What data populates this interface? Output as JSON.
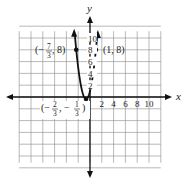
{
  "chart_data": {
    "type": "line",
    "title": "",
    "xlabel": "x",
    "ylabel": "y",
    "xlim": [
      -12,
      12
    ],
    "ylim": [
      -12,
      12
    ],
    "grid": true,
    "grid_step": 2,
    "x_tick_labels": [
      "2",
      "4",
      "6",
      "8",
      "10"
    ],
    "x_ticks": [
      2,
      4,
      6,
      8,
      10
    ],
    "y_tick_labels": [
      "2",
      "4",
      "6",
      "8",
      "10"
    ],
    "y_ticks": [
      2,
      4,
      6,
      8,
      10
    ],
    "series": [
      {
        "name": "parabola",
        "equation": "y = 3x^2 + 4x + 1",
        "vertex": [
          -0.6667,
          -0.3333
        ],
        "x": [
          -2.6,
          -2.3333,
          -2,
          -1.5,
          -1,
          -0.6667,
          -0.3333,
          0,
          0.5,
          1,
          1.25
        ],
        "y": [
          10.88,
          8,
          5,
          1.75,
          0,
          -0.3333,
          0,
          1,
          3.75,
          8,
          10.69
        ]
      }
    ],
    "annotations": [
      {
        "point": [
          -2.3333,
          8
        ],
        "label_text": "(−7/3, 8)",
        "num": "7",
        "den": "3",
        "prefix": "(−",
        "suffix": ", 8)"
      },
      {
        "point": [
          1,
          8
        ],
        "label_text": "(1, 8)"
      },
      {
        "point": [
          -0.6667,
          -0.3333
        ],
        "label_text": "(−2/3, −1/3)"
      }
    ]
  },
  "labels": {
    "x_axis": "x",
    "y_axis": "y",
    "point_right": "(1, 8)",
    "point_left_open": "(−",
    "point_left_num": "7",
    "point_left_den": "3",
    "point_left_close": ", 8)",
    "vertex_open": "(−",
    "vertex_num1": "2",
    "vertex_den1": "3",
    "vertex_mid": ", −",
    "vertex_num2": "1",
    "vertex_den2": "3",
    "vertex_close": ")"
  }
}
